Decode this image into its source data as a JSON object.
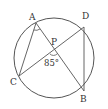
{
  "diagram": {
    "type": "circle-geometry",
    "circle": {
      "cx": 54,
      "cy": 58,
      "r": 40
    },
    "points": {
      "A": {
        "label": "A",
        "x": 36,
        "y": 23
      },
      "D": {
        "label": "D",
        "x": 84,
        "y": 27
      },
      "C": {
        "label": "C",
        "x": 19,
        "y": 76
      },
      "B": {
        "label": "B",
        "x": 84,
        "y": 91
      },
      "P": {
        "label": "P",
        "x": 54,
        "y": 51
      }
    },
    "segments": [
      [
        "A",
        "B"
      ],
      [
        "C",
        "D"
      ],
      [
        "A",
        "C"
      ],
      [
        "D",
        "B"
      ]
    ],
    "angle_label": "85°",
    "line_color": "#555555",
    "text_color": "#333333"
  }
}
